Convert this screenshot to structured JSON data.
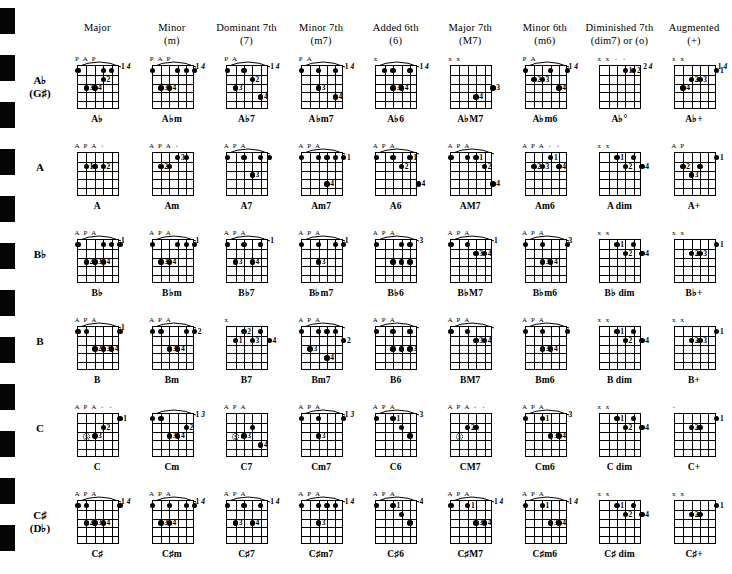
{
  "page": {
    "kind": "guitar-chord-chart"
  },
  "scan_marks": {
    "count": 12,
    "color": "#050505"
  },
  "columns": [
    {
      "name": "Major",
      "sub": ""
    },
    {
      "name": "Minor",
      "sub": "(m)"
    },
    {
      "name": "Dominant 7th",
      "sub": "(7)"
    },
    {
      "name": "Minor 7th",
      "sub": "(m7)"
    },
    {
      "name": "Added 6th",
      "sub": "(6)"
    },
    {
      "name": "Major 7th",
      "sub": "(M7)"
    },
    {
      "name": "Minor 6th",
      "sub": "(m6)"
    },
    {
      "name": "Diminished 7th",
      "sub": "(dim7) or (o)"
    },
    {
      "name": "Augmented",
      "sub": "(+)"
    }
  ],
  "rows": [
    {
      "label": "A♭",
      "alt": "(G♯)"
    },
    {
      "label": "A",
      "alt": ""
    },
    {
      "label": "B♭",
      "alt": ""
    },
    {
      "label": "B",
      "alt": ""
    },
    {
      "label": "C",
      "alt": ""
    },
    {
      "label": "C♯",
      "alt": "(D♭)"
    }
  ],
  "chords": [
    [
      {
        "name": "A♭",
        "marks": "P A P",
        "barre": true,
        "fret": "1 4",
        "dots": "6,1;3,1;2,1;3,2:2;5,3:3;4,3:4"
      },
      {
        "name": "A♭m",
        "marks": "P A P",
        "barre": true,
        "fret": "1 4",
        "dots": "6,1;3,1;2,1;1,1;5,3:3;4,3:4"
      },
      {
        "name": "A♭7",
        "marks": "P A",
        "barre": true,
        "fret": "1 4",
        "dots": "6,1;4,1;3,2:2;5,3:3;2,4:4"
      },
      {
        "name": "A♭m7",
        "marks": "P A",
        "barre": true,
        "fret": "1 4",
        "dots": "6,1;4,1;2,1;4,3:3;2,4:4"
      },
      {
        "name": "A♭6",
        "marks": "x",
        "barre": true,
        "fret": "1 4",
        "dots": "5,1;4,1;2,1;4,3:3;3,3:4"
      },
      {
        "name": "A♭M7",
        "marks": "x x",
        "barre": false,
        "fret": "",
        "dots": "1,3:3;3,4:4"
      },
      {
        "name": "A♭m6",
        "marks": "P A",
        "barre": true,
        "fret": "1 4",
        "dots": "6,1;3,1;1,1;5,2:2;4,2:3;2,3:4"
      },
      {
        "name": "A♭°",
        "marks": "x x o o",
        "barre": false,
        "fret": "2 4",
        "dots": "3,1:1;2,1:2"
      },
      {
        "name": "A♭+",
        "marks": "x x",
        "barre": false,
        "fret": "1 4",
        "dots": "1,1:1;4,2:2;3,2:3;5,3:4"
      }
    ],
    [
      {
        "name": "A",
        "marks": "A P A o",
        "barre": false,
        "fret": "",
        "dots": "5,2:1;4,2;3,2:2"
      },
      {
        "name": "Am",
        "marks": "A P A o",
        "barre": false,
        "fret": "",
        "dots": "5,2:2;4,2;3,1:3;2,1"
      },
      {
        "name": "A7",
        "marks": "A P A",
        "barre": true,
        "fret": "",
        "dots": "6,1;4,1;2,1;1,1;3,3:3"
      },
      {
        "name": "Am7",
        "marks": "A P A",
        "barre": true,
        "fret": "",
        "dots": "6,1;4,1;3,1;2,1;1,1:1;3,4:4"
      },
      {
        "name": "A6",
        "marks": "A P A",
        "barre": true,
        "fret": "",
        "dots": "6,1;4,1;2,1:1;3,2:2;1,4:4"
      },
      {
        "name": "AM7",
        "marks": "A P A",
        "barre": true,
        "fret": "",
        "dots": "6,1;4,1;3,1:1;2,2:2;1,4:4"
      },
      {
        "name": "Am6",
        "marks": "A P A o o",
        "barre": false,
        "fret": "",
        "dots": "5,2:2;4,2:3;3,1:1;2,2:4"
      },
      {
        "name": "A dim",
        "marks": "x x",
        "barre": false,
        "fret": "",
        "dots": "4,1:1;3,2:2;2,1;1,2:4"
      },
      {
        "name": "A+",
        "marks": "A P",
        "barre": false,
        "fret": "",
        "dots": "1,1:1;5,2:2;4,3:3;3,2"
      }
    ],
    [
      {
        "name": "B♭",
        "marks": "A P A",
        "barre": true,
        "fret": "1",
        "dots": "6,1;3,1;2,1;1,1;5,3:2;4,3:3;3,3:4"
      },
      {
        "name": "B♭m",
        "marks": "A P A",
        "barre": true,
        "fret": "1",
        "dots": "6,1;3,1;2,1;1,1;5,3:3;4,3:4"
      },
      {
        "name": "B♭7",
        "marks": "A P A",
        "barre": true,
        "fret": "1",
        "dots": "6,1;4,1;2,1;5,3:3;3,3:4"
      },
      {
        "name": "B♭m7",
        "marks": "A P A",
        "barre": true,
        "fret": "1",
        "dots": "6,1;4,1;2,1;1,1;4,3:3"
      },
      {
        "name": "B♭6",
        "marks": "A P A",
        "barre": true,
        "fret": "3",
        "dots": "6,1;3,1;2,1;4,3;3,3;2,3"
      },
      {
        "name": "B♭M7",
        "marks": "A P A",
        "barre": true,
        "fret": "1",
        "dots": "6,1;4,1;3,2:3;2,2:4"
      },
      {
        "name": "B♭m6",
        "marks": "A P A",
        "barre": true,
        "fret": "3",
        "dots": "6,1;4,1;1,1;4,3:3;3,3:4"
      },
      {
        "name": "B♭ dim",
        "marks": "x x",
        "barre": false,
        "fret": "",
        "dots": "4,1:1;3,2:2;2,1;1,2:4"
      },
      {
        "name": "B♭+",
        "marks": "x x",
        "barre": false,
        "fret": "",
        "dots": "1,1:1;4,2:2;3,2:3"
      }
    ],
    [
      {
        "name": "B",
        "marks": "A P A",
        "barre": true,
        "fret": "1",
        "dots": "6,1;5,1;1,1;4,3:2;3,3:3;2,3:4"
      },
      {
        "name": "Bm",
        "marks": "A P A",
        "barre": true,
        "fret": "",
        "dots": "6,1;5,1;4,3:3;3,3:4;2,1;1,1:2"
      },
      {
        "name": "B7",
        "marks": "x",
        "barre": false,
        "fret": "",
        "dots": "5,2:1;4,1:2;3,2:3;2,1;1,2:4"
      },
      {
        "name": "Bm7",
        "marks": "A P A",
        "barre": true,
        "fret": "",
        "dots": "6,1;4,1;3,1;2,1;1,2:2;5,3:3;3,4:4"
      },
      {
        "name": "B6",
        "marks": "A P A",
        "barre": true,
        "fret": "",
        "dots": "6,1;4,1;2,1;4,3;3,3;2,3:3"
      },
      {
        "name": "BM7",
        "marks": "A P A",
        "barre": true,
        "fret": "",
        "dots": "6,1;4,1;3,2:3;2,2:4"
      },
      {
        "name": "Bm6",
        "marks": "A P A",
        "barre": true,
        "fret": "",
        "dots": "6,1;4,1;1,1;4,3:3;3,3:4"
      },
      {
        "name": "B dim",
        "marks": "x x",
        "barre": false,
        "fret": "",
        "dots": "4,1:1;3,2:2;2,1;1,2:4"
      },
      {
        "name": "B+",
        "marks": "x x",
        "barre": false,
        "fret": "",
        "dots": "1,1:1;4,2:2;3,2:3"
      }
    ],
    [
      {
        "name": "C",
        "marks": "A P A o o",
        "barre": false,
        "fret": "",
        "dots": "5,3:3c;4,3:3;3,2:2;1,1:1"
      },
      {
        "name": "Cm",
        "marks": "",
        "barre": true,
        "fret": "1 3",
        "dots": "6,1;5,1;2,2:2;4,3:3;3,3:4"
      },
      {
        "name": "C7",
        "marks": "A P A",
        "barre": false,
        "fret": "",
        "dots": "5,3:3c;4,3:3;3,2;2,4:4"
      },
      {
        "name": "Cm7",
        "marks": "A P A",
        "barre": true,
        "fret": "1 3",
        "dots": "6,1;4,1;1,1;4,3:3"
      },
      {
        "name": "C6",
        "marks": "A P A",
        "barre": true,
        "fret": "3",
        "dots": "6,1;4,1:1;3,2;2,3"
      },
      {
        "name": "CM7",
        "marks": "A P A o o",
        "barre": false,
        "fret": "",
        "dots": "5,3:3c;4,2:2;3,2"
      },
      {
        "name": "Cm6",
        "marks": "A P A",
        "barre": true,
        "fret": "3",
        "dots": "6,1;4,1:1;3,3:3;2,3:4"
      },
      {
        "name": "C dim",
        "marks": "x x",
        "barre": false,
        "fret": "",
        "dots": "4,1:1;3,2:2;2,1;1,2:4"
      },
      {
        "name": "C+",
        "marks": "o",
        "barre": false,
        "fret": "",
        "dots": "1,1:1;4,2:2;3,2"
      }
    ],
    [
      {
        "name": "C♯",
        "marks": "A P A",
        "barre": true,
        "fret": "1 4",
        "dots": "6,1;5,1;1,1;5,3:2;4,3:3;3,3:4"
      },
      {
        "name": "C♯m",
        "marks": "A P A",
        "barre": true,
        "fret": "1 4",
        "dots": "6,1;4,1;2,1;1,1;5,3:3;4,3:4"
      },
      {
        "name": "C♯7",
        "marks": "A P A",
        "barre": true,
        "fret": "1 4",
        "dots": "6,1;4,1;2,1;5,3:3;3,3:4"
      },
      {
        "name": "C♯m7",
        "marks": "A P A",
        "barre": true,
        "fret": "1 4",
        "dots": "6,1;4,1;3,1;2,1;4,3:3"
      },
      {
        "name": "C♯6",
        "marks": "A P A",
        "barre": true,
        "fret": "4",
        "dots": "6,1;4,1:1;3,2;2,3"
      },
      {
        "name": "C♯M7",
        "marks": "A P A",
        "barre": true,
        "fret": "1 4",
        "dots": "6,1;4,1:1;3,3:3;2,3:4"
      },
      {
        "name": "C♯m6",
        "marks": "A P A",
        "barre": true,
        "fret": "1 4",
        "dots": "6,1;4,1:1;3,3:3;2,3:4"
      },
      {
        "name": "C♯ dim",
        "marks": "x x",
        "barre": false,
        "fret": "",
        "dots": "4,1:1;3,2:2;2,1;1,2:4"
      },
      {
        "name": "C♯+",
        "marks": "x x",
        "barre": false,
        "fret": "",
        "dots": "1,1:1;4,2:2;3,2"
      }
    ]
  ]
}
